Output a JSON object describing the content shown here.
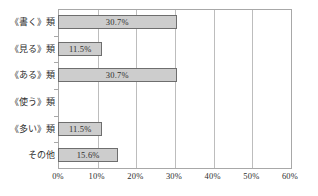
{
  "chart_data": {
    "type": "bar",
    "orientation": "horizontal",
    "title": "",
    "subtitle": "",
    "xlabel": "",
    "ylabel": "",
    "categories": [
      "《書く》類",
      "《見る》類",
      "《ある》類",
      "《使う》類",
      "《多い》類",
      "その他"
    ],
    "values": [
      30.7,
      11.5,
      30.7,
      0,
      11.5,
      15.6
    ],
    "value_labels": [
      "30.7%",
      "11.5%",
      "30.7%",
      "",
      "11.5%",
      "15.6%"
    ],
    "xlim": [
      0,
      60
    ],
    "xticks": [
      0,
      10,
      20,
      30,
      40,
      50,
      60
    ],
    "xtick_labels": [
      "0%",
      "10%",
      "20%",
      "30%",
      "40%",
      "50%",
      "60%"
    ],
    "grid": true,
    "grid_axis": "x",
    "legend": false,
    "legend_position": "none",
    "unit": "%"
  },
  "style": {
    "bar_fill": "#cdcdcd",
    "bar_border": "#6e6e6e",
    "gridline_color": "#bdbdbd",
    "axis_color": "#a8a8a8",
    "text_color": "#2f2f2f",
    "background": "#ffffff"
  }
}
